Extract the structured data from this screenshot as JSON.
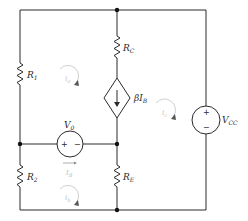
{
  "diagram": {
    "type": "circuit-schematic",
    "components": {
      "r1": {
        "symbol": "R",
        "sub": "1"
      },
      "r2": {
        "symbol": "R",
        "sub": "2"
      },
      "rc": {
        "symbol": "R",
        "sub": "C"
      },
      "re": {
        "symbol": "R",
        "sub": "E"
      },
      "dependent_source": {
        "symbol": "βI",
        "sub": "B"
      },
      "vo": {
        "symbol": "V",
        "sub": "0",
        "plus": "+",
        "minus": "−"
      },
      "vcc": {
        "symbol": "V",
        "sub": "CC",
        "plus": "+",
        "minus": "−"
      }
    },
    "currents": {
      "ib_branch": {
        "symbol": "I",
        "sub": "B"
      },
      "mesh_a": {
        "symbol": "i",
        "sub": "a"
      },
      "mesh_b": {
        "symbol": "i",
        "sub": "b"
      },
      "mesh_c": {
        "symbol": "i",
        "sub": "c"
      }
    },
    "colors": {
      "wire": "#2a2a2a",
      "mesh_annotation": "#c8c8c8"
    }
  }
}
